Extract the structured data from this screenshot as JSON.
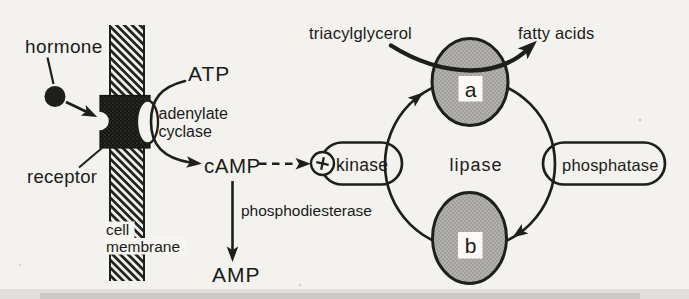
{
  "diagram": {
    "labels": {
      "hormone": "hormone",
      "receptor": "receptor",
      "cell_membrane": [
        "cell",
        "membrane"
      ],
      "atp": "ATP",
      "adenylate_cyclase": [
        "adenylate",
        "cyclase"
      ],
      "camp": "cAMP",
      "phosphodiesterase": "phosphodiesterase",
      "amp": "AMP",
      "kinase": "kinase",
      "lipase": "lipase",
      "phosphatase": "phosphatase",
      "triacylglycerol": "triacylglycerol",
      "fatty_acids": "fatty acids",
      "lipase_form_a": "a",
      "lipase_form_b": "b"
    },
    "icons": {
      "activation": "plus-in-circle"
    },
    "colors": {
      "paper": "#f3f2ee",
      "ink": "#1e1e1c",
      "enzyme_fill": "#b2b1ae",
      "receptor_fill": "#161614"
    }
  }
}
